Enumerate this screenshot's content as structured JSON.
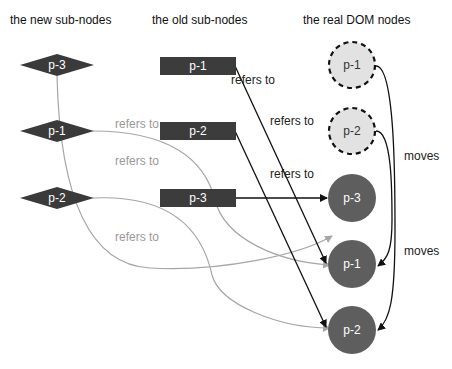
{
  "headers": {
    "new": "the new sub-nodes",
    "old": "the old sub-nodes",
    "real": "the real DOM nodes"
  },
  "new_nodes": [
    {
      "label": "p-3"
    },
    {
      "label": "p-1"
    },
    {
      "label": "p-2"
    }
  ],
  "old_nodes": [
    {
      "label": "p-1"
    },
    {
      "label": "p-2"
    },
    {
      "label": "p-3"
    }
  ],
  "real_nodes": [
    {
      "label": "p-1",
      "state": "removed-placeholder"
    },
    {
      "label": "p-2",
      "state": "removed-placeholder"
    },
    {
      "label": "p-3",
      "state": "present"
    },
    {
      "label": "p-1",
      "state": "present"
    },
    {
      "label": "p-2",
      "state": "present"
    }
  ],
  "edge_labels": {
    "new_refers_1": "refers to",
    "new_refers_2": "refers to",
    "new_refers_3": "refers to",
    "old_refers_1": "refers to",
    "old_refers_2": "refers to",
    "old_refers_3": "refers to",
    "moves_1": "moves",
    "moves_2": "moves"
  },
  "colors": {
    "diamond": "#3a3a3a",
    "rect": "#3c3c3c",
    "circle_present": "#5e5e5e",
    "circle_placeholder": "#e2e2e2",
    "edge_old": "#111111",
    "edge_new": "#a6a6a6"
  }
}
